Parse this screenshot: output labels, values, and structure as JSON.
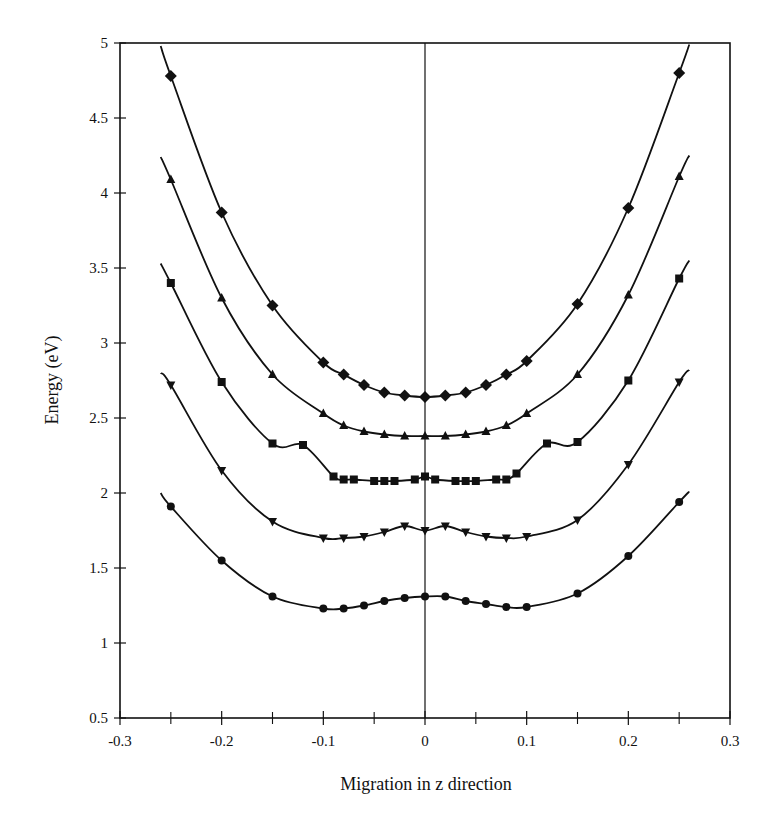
{
  "chart_data": {
    "type": "line",
    "title": "",
    "xlabel": "Migration in z direction",
    "ylabel": "Energy (eV)",
    "xlim": [
      -0.3,
      0.3
    ],
    "ylim": [
      0.5,
      5
    ],
    "xticks": [
      -0.3,
      -0.2,
      -0.1,
      0,
      0.1,
      0.2,
      0.3
    ],
    "xtick_labels": [
      "-0.3",
      "-0.2",
      "-0.1",
      "0",
      "0.1",
      "0.2",
      "0.3"
    ],
    "xminor_ticks": [
      -0.25,
      -0.15,
      -0.05,
      0.05,
      0.15,
      0.25
    ],
    "yticks": [
      0.5,
      1,
      1.5,
      2,
      2.5,
      3,
      3.5,
      4,
      4.5,
      5
    ],
    "ytick_labels": [
      "0.5",
      "1",
      "1.5",
      "2",
      "2.5",
      "3",
      "3.5",
      "4",
      "4.5",
      "5"
    ],
    "grid": false,
    "legend": null,
    "vertical_line_at_x": 0,
    "series": [
      {
        "name": "diamond series",
        "marker": "diamond",
        "color": "#111111",
        "x": [
          -0.25,
          -0.2,
          -0.15,
          -0.1,
          -0.08,
          -0.06,
          -0.04,
          -0.02,
          0,
          0.02,
          0.04,
          0.06,
          0.08,
          0.1,
          0.15,
          0.2,
          0.25
        ],
        "y": [
          4.78,
          3.87,
          3.25,
          2.87,
          2.79,
          2.72,
          2.67,
          2.65,
          2.64,
          2.65,
          2.67,
          2.72,
          2.79,
          2.88,
          3.26,
          3.9,
          4.8
        ],
        "curve_ends": [
          [
            -0.26,
            4.98
          ],
          [
            0.26,
            4.99
          ]
        ]
      },
      {
        "name": "triangle series",
        "marker": "triangle-up",
        "color": "#111111",
        "x": [
          -0.25,
          -0.2,
          -0.15,
          -0.1,
          -0.08,
          -0.06,
          -0.04,
          -0.02,
          0,
          0.02,
          0.04,
          0.06,
          0.08,
          0.1,
          0.15,
          0.2,
          0.25
        ],
        "y": [
          4.09,
          3.3,
          2.79,
          2.53,
          2.45,
          2.41,
          2.39,
          2.38,
          2.38,
          2.38,
          2.39,
          2.41,
          2.45,
          2.53,
          2.79,
          3.32,
          4.11
        ],
        "curve_ends": [
          [
            -0.26,
            4.24
          ],
          [
            0.26,
            4.25
          ]
        ]
      },
      {
        "name": "square series",
        "marker": "square",
        "color": "#111111",
        "x": [
          -0.25,
          -0.2,
          -0.15,
          -0.12,
          -0.09,
          -0.08,
          -0.07,
          -0.05,
          -0.04,
          -0.03,
          -0.01,
          0,
          0.01,
          0.03,
          0.04,
          0.05,
          0.07,
          0.08,
          0.09,
          0.12,
          0.15,
          0.2,
          0.25
        ],
        "y": [
          3.4,
          2.74,
          2.33,
          2.32,
          2.11,
          2.09,
          2.09,
          2.08,
          2.08,
          2.08,
          2.09,
          2.11,
          2.09,
          2.08,
          2.08,
          2.08,
          2.09,
          2.09,
          2.13,
          2.33,
          2.34,
          2.75,
          3.43
        ],
        "curve_ends": [
          [
            -0.26,
            3.53
          ],
          [
            0.26,
            3.55
          ]
        ]
      },
      {
        "name": "inverted triangle series",
        "marker": "triangle-down",
        "color": "#111111",
        "x": [
          -0.25,
          -0.2,
          -0.15,
          -0.1,
          -0.08,
          -0.06,
          -0.04,
          -0.02,
          0,
          0.02,
          0.04,
          0.06,
          0.08,
          0.1,
          0.15,
          0.2,
          0.25
        ],
        "y": [
          2.72,
          2.15,
          1.81,
          1.7,
          1.7,
          1.71,
          1.74,
          1.78,
          1.75,
          1.78,
          1.74,
          1.71,
          1.7,
          1.71,
          1.82,
          2.19,
          2.74
        ],
        "curve_ends": [
          [
            -0.26,
            2.8
          ],
          [
            0.26,
            2.82
          ]
        ]
      },
      {
        "name": "circle series",
        "marker": "circle",
        "color": "#111111",
        "x": [
          -0.25,
          -0.2,
          -0.15,
          -0.1,
          -0.08,
          -0.06,
          -0.04,
          -0.02,
          0,
          0.02,
          0.04,
          0.06,
          0.08,
          0.1,
          0.15,
          0.2,
          0.25
        ],
        "y": [
          1.91,
          1.55,
          1.31,
          1.23,
          1.23,
          1.25,
          1.28,
          1.3,
          1.31,
          1.31,
          1.28,
          1.26,
          1.24,
          1.24,
          1.33,
          1.58,
          1.94
        ],
        "curve_ends": [
          [
            -0.26,
            2.0
          ],
          [
            0.26,
            2.01
          ]
        ]
      }
    ]
  },
  "axes": {
    "xlabel": "Migration in z direction",
    "ylabel": "Energy (eV)"
  }
}
